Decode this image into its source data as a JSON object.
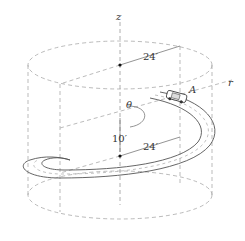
{
  "diagram": {
    "axes": {
      "z_label": "z",
      "r_label": "r",
      "theta_label": "θ"
    },
    "dimensions": {
      "top_radius": "24′",
      "bottom_radius": "24′",
      "height": "10′"
    },
    "point_label": "A",
    "colors": {
      "line": "#555555",
      "dashed": "#aaaaaa",
      "text": "#333333"
    }
  }
}
